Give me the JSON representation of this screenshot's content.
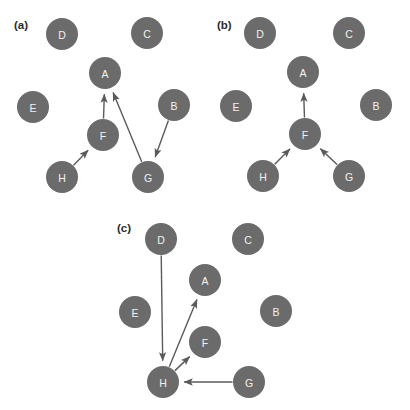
{
  "figure": {
    "type": "directed-graph-panels",
    "width": 410,
    "height": 410,
    "background_color": "#ffffff",
    "node_color": "#6b6b6b",
    "node_label_color": "#f2f2f2",
    "edge_color": "#5a5a5a",
    "panel_label_color": "#2b2b2b",
    "node_radius": 16,
    "edge_width": 1.4
  },
  "panels": [
    {
      "id": "panel-a",
      "label": "(a)",
      "label_x": 14,
      "label_y": 29,
      "nodes": [
        {
          "id": "D",
          "label": "D",
          "x": 62,
          "y": 34
        },
        {
          "id": "C",
          "label": "C",
          "x": 147,
          "y": 33
        },
        {
          "id": "A",
          "label": "A",
          "x": 105,
          "y": 73
        },
        {
          "id": "E",
          "label": "E",
          "x": 33,
          "y": 107
        },
        {
          "id": "B",
          "label": "B",
          "x": 174,
          "y": 105
        },
        {
          "id": "F",
          "label": "F",
          "x": 103,
          "y": 135
        },
        {
          "id": "H",
          "label": "H",
          "x": 62,
          "y": 177
        },
        {
          "id": "G",
          "label": "G",
          "x": 148,
          "y": 177
        }
      ],
      "edges": [
        {
          "from": "F",
          "to": "A"
        },
        {
          "from": "G",
          "to": "A"
        },
        {
          "from": "B",
          "to": "G"
        },
        {
          "from": "H",
          "to": "F"
        }
      ]
    },
    {
      "id": "panel-b",
      "label": "(b)",
      "label_x": 217,
      "label_y": 29,
      "nodes": [
        {
          "id": "D",
          "label": "D",
          "x": 260,
          "y": 33
        },
        {
          "id": "C",
          "label": "C",
          "x": 349,
          "y": 33
        },
        {
          "id": "A",
          "label": "A",
          "x": 303,
          "y": 72
        },
        {
          "id": "E",
          "label": "E",
          "x": 236,
          "y": 106
        },
        {
          "id": "B",
          "label": "B",
          "x": 376,
          "y": 105
        },
        {
          "id": "F",
          "label": "F",
          "x": 305,
          "y": 134
        },
        {
          "id": "H",
          "label": "H",
          "x": 263,
          "y": 176
        },
        {
          "id": "G",
          "label": "G",
          "x": 349,
          "y": 176
        }
      ],
      "edges": [
        {
          "from": "F",
          "to": "A"
        },
        {
          "from": "H",
          "to": "F"
        },
        {
          "from": "G",
          "to": "F"
        }
      ]
    },
    {
      "id": "panel-c",
      "label": "(c)",
      "label_x": 117,
      "label_y": 232,
      "nodes": [
        {
          "id": "D",
          "label": "D",
          "x": 161,
          "y": 239
        },
        {
          "id": "C",
          "label": "C",
          "x": 248,
          "y": 239
        },
        {
          "id": "A",
          "label": "A",
          "x": 205,
          "y": 280
        },
        {
          "id": "E",
          "label": "E",
          "x": 135,
          "y": 312
        },
        {
          "id": "B",
          "label": "B",
          "x": 276,
          "y": 311
        },
        {
          "id": "F",
          "label": "F",
          "x": 205,
          "y": 342
        },
        {
          "id": "H",
          "label": "H",
          "x": 163,
          "y": 382
        },
        {
          "id": "G",
          "label": "G",
          "x": 249,
          "y": 382
        }
      ],
      "edges": [
        {
          "from": "D",
          "to": "H"
        },
        {
          "from": "H",
          "to": "A"
        },
        {
          "from": "H",
          "to": "F"
        },
        {
          "from": "G",
          "to": "H"
        }
      ]
    }
  ]
}
